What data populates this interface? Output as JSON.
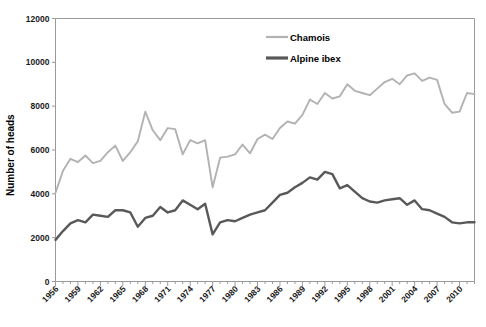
{
  "chart_data": {
    "type": "line",
    "title": "",
    "xlabel": "",
    "ylabel": "Number of heads",
    "xlim": [
      1956,
      2012
    ],
    "ylim": [
      0,
      12000
    ],
    "ytick_labels": [
      "0",
      "2000",
      "4000",
      "6000",
      "8000",
      "10000",
      "12000"
    ],
    "ytick_values": [
      0,
      2000,
      4000,
      6000,
      8000,
      10000,
      12000
    ],
    "xtick_labels": [
      "1956",
      "1959",
      "1962",
      "1965",
      "1968",
      "1971",
      "1974",
      "1977",
      "1980",
      "1983",
      "1986",
      "1989",
      "1992",
      "1995",
      "1998",
      "2001",
      "2004",
      "2007",
      "2010"
    ],
    "xtick_values": [
      1956,
      1959,
      1962,
      1965,
      1968,
      1971,
      1974,
      1977,
      1980,
      1983,
      1986,
      1989,
      1992,
      1995,
      1998,
      2001,
      2004,
      2007,
      2010
    ],
    "grid": false,
    "legend_position": "top-center",
    "x": [
      1956,
      1957,
      1958,
      1959,
      1960,
      1961,
      1962,
      1963,
      1964,
      1965,
      1966,
      1967,
      1968,
      1969,
      1970,
      1971,
      1972,
      1973,
      1974,
      1975,
      1976,
      1977,
      1978,
      1979,
      1980,
      1981,
      1982,
      1983,
      1984,
      1985,
      1986,
      1987,
      1988,
      1989,
      1990,
      1991,
      1992,
      1993,
      1994,
      1995,
      1996,
      1997,
      1998,
      1999,
      2000,
      2001,
      2002,
      2003,
      2004,
      2005,
      2006,
      2007,
      2008,
      2009,
      2010,
      2011,
      2012
    ],
    "series": [
      {
        "name": "Chamois",
        "color": "#b2b2b2",
        "values": [
          4050,
          5050,
          5600,
          5450,
          5750,
          5400,
          5500,
          5900,
          6200,
          5500,
          5900,
          6400,
          7750,
          6900,
          6450,
          7000,
          6950,
          5800,
          6450,
          6300,
          6450,
          4300,
          5650,
          5700,
          5800,
          6250,
          5850,
          6500,
          6700,
          6500,
          7000,
          7300,
          7200,
          7600,
          8300,
          8100,
          8600,
          8350,
          8450,
          9000,
          8700,
          8600,
          8500,
          8800,
          9100,
          9250,
          9000,
          9400,
          9500,
          9150,
          9300,
          9200,
          8100,
          7700,
          7750,
          8600,
          8550
        ]
      },
      {
        "name": "Alpine ibex",
        "color": "#595959",
        "values": [
          1900,
          2300,
          2650,
          2800,
          2700,
          3050,
          3000,
          2950,
          3250,
          3250,
          3150,
          2500,
          2900,
          3000,
          3400,
          3150,
          3250,
          3700,
          3500,
          3300,
          3550,
          2150,
          2700,
          2800,
          2750,
          2900,
          3050,
          3150,
          3250,
          3600,
          3950,
          4050,
          4300,
          4500,
          4750,
          4650,
          5000,
          4900,
          4250,
          4400,
          4100,
          3800,
          3650,
          3600,
          3700,
          3750,
          3800,
          3500,
          3700,
          3300,
          3250,
          3100,
          2950,
          2700,
          2650,
          2700,
          2700
        ]
      }
    ]
  },
  "legend": {
    "items": [
      {
        "label": "Chamois",
        "color": "#b2b2b2",
        "width": 2.2
      },
      {
        "label": "Alpine ibex",
        "color": "#595959",
        "width": 3.2
      }
    ]
  }
}
